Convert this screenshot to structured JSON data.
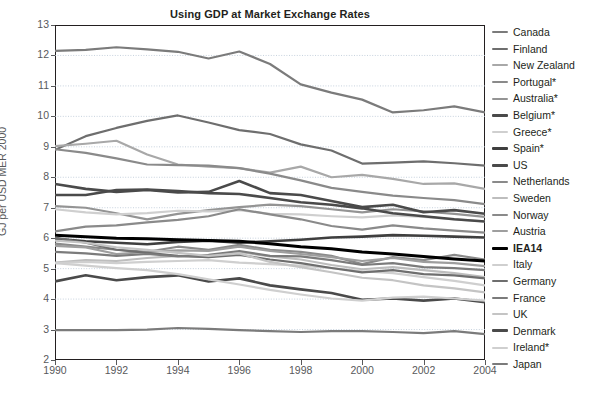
{
  "chart_data": {
    "type": "line",
    "title": "Using GDP at Market Exchange Rates",
    "xlabel": "",
    "ylabel": "GJ per USD MER 2000",
    "x": [
      1990,
      1991,
      1992,
      1993,
      1994,
      1995,
      1996,
      1997,
      1998,
      1999,
      2000,
      2001,
      2002,
      2003,
      2004
    ],
    "xlim": [
      1990,
      2004
    ],
    "ylim": [
      2,
      13
    ],
    "xticks": [
      "1990",
      "1992",
      "1994",
      "1996",
      "1998",
      "2000",
      "2002",
      "2004"
    ],
    "yticks": [
      "2",
      "3",
      "4",
      "5",
      "6",
      "7",
      "8",
      "9",
      "10",
      "11",
      "12",
      "13"
    ],
    "grid": true,
    "legend_position": "right",
    "note": "Asterisk (*) marks countries noted in the source legend",
    "series": [
      {
        "name": "Canada",
        "color": "#7b7b7b",
        "width": 2.2,
        "values": [
          12.15,
          12.18,
          12.27,
          12.2,
          12.12,
          11.9,
          12.13,
          11.72,
          11.05,
          10.78,
          10.55,
          10.13,
          10.2,
          10.33,
          10.13
        ]
      },
      {
        "name": "Finland",
        "color": "#6e6e6e",
        "width": 2.2,
        "values": [
          8.9,
          9.35,
          9.62,
          9.85,
          10.03,
          9.8,
          9.55,
          9.42,
          9.08,
          8.88,
          8.45,
          8.48,
          8.52,
          8.46,
          8.38
        ]
      },
      {
        "name": "New Zealand",
        "color": "#a8a8a8",
        "width": 2.2,
        "values": [
          9.02,
          9.1,
          9.2,
          8.75,
          8.42,
          8.35,
          8.3,
          8.15,
          8.35,
          8.0,
          8.08,
          7.95,
          7.78,
          7.8,
          7.62
        ]
      },
      {
        "name": "Portugal*",
        "color": "#8a8a8a",
        "width": 2.2,
        "values": [
          8.92,
          8.8,
          8.62,
          8.42,
          8.4,
          8.38,
          8.3,
          8.12,
          7.9,
          7.65,
          7.52,
          7.4,
          7.32,
          7.25,
          7.12
        ]
      },
      {
        "name": "Australia*",
        "color": "#949494",
        "width": 2.2,
        "values": [
          7.05,
          7.0,
          6.82,
          6.62,
          6.8,
          6.92,
          7.02,
          7.1,
          7.05,
          6.95,
          6.85,
          6.95,
          6.88,
          6.8,
          6.7
        ]
      },
      {
        "name": "Belgium*",
        "color": "#4a4a4a",
        "width": 2.6,
        "values": [
          7.78,
          7.62,
          7.52,
          7.58,
          7.5,
          7.52,
          7.88,
          7.48,
          7.42,
          7.22,
          7.02,
          7.1,
          6.85,
          6.92,
          6.8
        ]
      },
      {
        "name": "Greece*",
        "color": "#cfcfcf",
        "width": 2.2,
        "values": [
          6.95,
          6.85,
          6.78,
          6.82,
          6.9,
          6.88,
          6.92,
          6.8,
          6.78,
          6.72,
          6.68,
          6.75,
          6.7,
          6.62,
          6.55
        ]
      },
      {
        "name": "Spain*",
        "color": "#3f3f3f",
        "width": 2.6,
        "values": [
          5.98,
          5.9,
          5.85,
          5.8,
          5.88,
          5.92,
          5.85,
          5.9,
          5.95,
          6.02,
          6.05,
          6.1,
          6.08,
          6.05,
          6.02
        ]
      },
      {
        "name": "US",
        "color": "#4a4a4a",
        "width": 2.6,
        "values": [
          7.42,
          7.42,
          7.58,
          7.6,
          7.55,
          7.48,
          7.45,
          7.32,
          7.18,
          7.1,
          6.98,
          6.82,
          6.72,
          6.62,
          6.55
        ]
      },
      {
        "name": "Netherlands",
        "color": "#8a8a8a",
        "width": 2.2,
        "values": [
          6.22,
          6.38,
          6.42,
          6.52,
          6.6,
          6.72,
          6.95,
          6.78,
          6.62,
          6.4,
          6.28,
          6.42,
          6.32,
          6.25,
          6.18
        ]
      },
      {
        "name": "Sweden",
        "color": "#bdbdbd",
        "width": 2.2,
        "values": [
          5.2,
          5.28,
          5.25,
          5.35,
          5.42,
          5.38,
          5.55,
          5.4,
          5.3,
          5.12,
          4.98,
          5.05,
          4.95,
          4.85,
          4.72
        ]
      },
      {
        "name": "Norway",
        "color": "#8a8a8a",
        "width": 2.2,
        "values": [
          5.82,
          5.72,
          5.62,
          5.55,
          5.72,
          5.62,
          5.78,
          5.62,
          5.55,
          5.42,
          5.15,
          5.38,
          5.28,
          5.45,
          5.3
        ]
      },
      {
        "name": "Austria",
        "color": "#9e9e9e",
        "width": 2.2,
        "values": [
          5.75,
          5.7,
          5.48,
          5.55,
          5.6,
          5.58,
          5.72,
          5.58,
          5.48,
          5.38,
          5.25,
          5.35,
          5.22,
          5.18,
          5.08
        ]
      },
      {
        "name": "IEA14",
        "color": "#000000",
        "width": 3.0,
        "values": [
          6.1,
          6.05,
          6.0,
          5.98,
          5.95,
          5.92,
          5.9,
          5.82,
          5.72,
          5.65,
          5.55,
          5.48,
          5.4,
          5.32,
          5.25
        ]
      },
      {
        "name": "Italy",
        "color": "#cfcfcf",
        "width": 2.2,
        "values": [
          5.18,
          5.22,
          5.18,
          5.22,
          5.25,
          5.28,
          5.2,
          5.15,
          5.1,
          5.02,
          4.92,
          4.85,
          4.72,
          4.6,
          4.45
        ]
      },
      {
        "name": "Germany",
        "color": "#6e6e6e",
        "width": 2.2,
        "values": [
          6.02,
          5.85,
          5.62,
          5.52,
          5.42,
          5.38,
          5.45,
          5.3,
          5.18,
          5.02,
          4.88,
          4.95,
          4.82,
          4.78,
          4.68
        ]
      },
      {
        "name": "France",
        "color": "#7b7b7b",
        "width": 2.2,
        "values": [
          5.55,
          5.5,
          5.42,
          5.48,
          5.4,
          5.45,
          5.58,
          5.42,
          5.4,
          5.28,
          5.12,
          5.18,
          5.05,
          5.02,
          4.95
        ]
      },
      {
        "name": "UK",
        "color": "#c4c4c4",
        "width": 2.2,
        "values": [
          5.92,
          5.85,
          5.7,
          5.62,
          5.52,
          5.42,
          5.5,
          5.22,
          5.05,
          4.88,
          4.7,
          4.62,
          4.45,
          4.35,
          4.22
        ]
      },
      {
        "name": "Denmark",
        "color": "#4a4a4a",
        "width": 2.6,
        "values": [
          4.58,
          4.78,
          4.62,
          4.72,
          4.78,
          4.58,
          4.68,
          4.45,
          4.32,
          4.2,
          3.98,
          4.02,
          3.95,
          4.02,
          3.9
        ]
      },
      {
        "name": "Ireland*",
        "color": "#cfcfcf",
        "width": 2.2,
        "values": [
          5.18,
          5.1,
          5.02,
          4.95,
          4.82,
          4.65,
          4.48,
          4.3,
          4.15,
          4.02,
          3.95,
          4.05,
          4.08,
          4.02,
          3.95
        ]
      },
      {
        "name": "Japan",
        "color": "#7b7b7b",
        "width": 2.2,
        "values": [
          2.98,
          2.98,
          2.98,
          3.0,
          3.05,
          3.02,
          2.98,
          2.95,
          2.92,
          2.95,
          2.95,
          2.92,
          2.88,
          2.95,
          2.85
        ]
      }
    ]
  },
  "legend": {
    "items": [
      {
        "label": "Canada",
        "color": "#7b7b7b",
        "bold": false,
        "thick": false
      },
      {
        "label": "Finland",
        "color": "#6e6e6e",
        "bold": false,
        "thick": false
      },
      {
        "label": "New Zealand",
        "color": "#a8a8a8",
        "bold": false,
        "thick": false
      },
      {
        "label": "Portugal*",
        "color": "#8a8a8a",
        "bold": false,
        "thick": false
      },
      {
        "label": "Australia*",
        "color": "#949494",
        "bold": false,
        "thick": false
      },
      {
        "label": "Belgium*",
        "color": "#4a4a4a",
        "bold": false,
        "thick": true
      },
      {
        "label": "Greece*",
        "color": "#cfcfcf",
        "bold": false,
        "thick": false
      },
      {
        "label": "Spain*",
        "color": "#3f3f3f",
        "bold": false,
        "thick": true
      },
      {
        "label": "US",
        "color": "#4a4a4a",
        "bold": false,
        "thick": true
      },
      {
        "label": "Netherlands",
        "color": "#8a8a8a",
        "bold": false,
        "thick": false
      },
      {
        "label": "Sweden",
        "color": "#bdbdbd",
        "bold": false,
        "thick": false
      },
      {
        "label": "Norway",
        "color": "#8a8a8a",
        "bold": false,
        "thick": false
      },
      {
        "label": "Austria",
        "color": "#9e9e9e",
        "bold": false,
        "thick": false
      },
      {
        "label": "IEA14",
        "color": "#000000",
        "bold": true,
        "thick": true
      },
      {
        "label": "Italy",
        "color": "#cfcfcf",
        "bold": false,
        "thick": false
      },
      {
        "label": "Germany",
        "color": "#6e6e6e",
        "bold": false,
        "thick": false
      },
      {
        "label": "France",
        "color": "#7b7b7b",
        "bold": false,
        "thick": false
      },
      {
        "label": "UK",
        "color": "#c4c4c4",
        "bold": false,
        "thick": false
      },
      {
        "label": "Denmark",
        "color": "#4a4a4a",
        "bold": false,
        "thick": true
      },
      {
        "label": "Ireland*",
        "color": "#cfcfcf",
        "bold": false,
        "thick": false
      },
      {
        "label": "Japan",
        "color": "#7b7b7b",
        "bold": false,
        "thick": false
      }
    ]
  },
  "style": {
    "axis_color": "#231f20",
    "tick_text_color": "#58595b",
    "grid_color": "#b9c6d6",
    "title_color": "#231f20"
  }
}
